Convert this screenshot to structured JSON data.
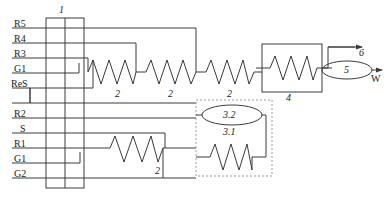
{
  "diagram": {
    "colors": {
      "line": "#3a3a3a",
      "text": "#1a1a1a",
      "dashed": "#9a9a9a",
      "background": "#ffffff"
    },
    "terminal_block": {
      "ref": "1",
      "terminals": [
        {
          "id": "t1",
          "label": "R5"
        },
        {
          "id": "t2",
          "label": "R4"
        },
        {
          "id": "t3",
          "label": "R3"
        },
        {
          "id": "t4",
          "label": "G1"
        },
        {
          "id": "t5",
          "label": "ReS"
        },
        {
          "id": "t6",
          "label": ""
        },
        {
          "id": "t7",
          "label": "R2"
        },
        {
          "id": "t8",
          "label": "S"
        },
        {
          "id": "t9",
          "label": "R1"
        },
        {
          "id": "t10",
          "label": "G1"
        },
        {
          "id": "t11",
          "label": "G2"
        }
      ]
    },
    "resistors": [
      {
        "id": "r-top-1",
        "ref": "2"
      },
      {
        "id": "r-top-2",
        "ref": "2"
      },
      {
        "id": "r-top-3",
        "ref": "2"
      },
      {
        "id": "r-bottom-1",
        "ref": "2"
      }
    ],
    "box4": {
      "ref": "4"
    },
    "dashed_module": {
      "ellipse_ref": "3.2",
      "resistor_ref": "3.1"
    },
    "ellipse5": {
      "ref": "5"
    },
    "arrows": [
      {
        "id": "arrow-6",
        "label": "6"
      },
      {
        "id": "arrow-w",
        "label": "W"
      }
    ]
  }
}
